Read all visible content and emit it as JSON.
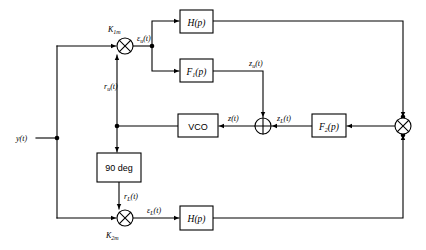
{
  "diagram": {
    "background_color": "#ffffff",
    "line_color": "#000000",
    "blocks": [
      {
        "id": "h_top",
        "label": "H(p)",
        "x": 180,
        "y": 10,
        "w": 33,
        "h": 23,
        "italic": true
      },
      {
        "id": "f1",
        "label": "F",
        "sub": "1",
        "tail": "(p)",
        "x": 180,
        "y": 59,
        "w": 33,
        "h": 23,
        "italic": true
      },
      {
        "id": "vco",
        "label": "VCO",
        "x": 178,
        "y": 114,
        "w": 40,
        "h": 23,
        "italic": false
      },
      {
        "id": "f2",
        "label": "F",
        "sub": "2",
        "tail": "(p)",
        "x": 312,
        "y": 114,
        "w": 34,
        "h": 23,
        "italic": true
      },
      {
        "id": "ninety",
        "label": "90 deg",
        "x": 97,
        "y": 153,
        "w": 44,
        "h": 29,
        "italic": false
      },
      {
        "id": "h_bottom",
        "label": "H(p)",
        "x": 180,
        "y": 206,
        "w": 33,
        "h": 24,
        "italic": true
      }
    ],
    "operators": [
      {
        "id": "mult_k1m",
        "type": "multiplier",
        "symbol": "cross",
        "cx": 125,
        "cy": 46,
        "r": 8
      },
      {
        "id": "mult_k2m",
        "type": "multiplier",
        "symbol": "cross",
        "cx": 125,
        "cy": 218,
        "r": 8
      },
      {
        "id": "summer",
        "type": "summer",
        "symbol": "plus",
        "cx": 263,
        "cy": 126,
        "r": 8
      },
      {
        "id": "mult_right",
        "type": "multiplier",
        "symbol": "cross",
        "cx": 403,
        "cy": 126,
        "r": 8
      }
    ],
    "gain_labels": [
      {
        "id": "k1m",
        "base": "K",
        "sub": "1m",
        "x": 108,
        "y": 32
      },
      {
        "id": "k2m",
        "base": "K",
        "sub": "2m",
        "x": 108,
        "y": 238
      }
    ],
    "signal_labels": [
      {
        "id": "y_t",
        "base": "y",
        "sub": "",
        "tail": "(t)",
        "x": 16,
        "y": 141
      },
      {
        "id": "eps_u",
        "base": "ε",
        "sub": "u",
        "tail": "(t)",
        "x": 141,
        "y": 41
      },
      {
        "id": "r_u",
        "base": "r",
        "sub": "u",
        "tail": "(t)",
        "x": 110,
        "y": 89
      },
      {
        "id": "r_L",
        "base": "r",
        "sub": "L",
        "tail": "(t)",
        "x": 127,
        "y": 199
      },
      {
        "id": "eps_L",
        "base": "ε",
        "sub": "L",
        "tail": "(t)",
        "x": 148,
        "y": 213
      },
      {
        "id": "z_u",
        "base": "z",
        "sub": "u",
        "tail": "(t)",
        "x": 249,
        "y": 66
      },
      {
        "id": "z_t",
        "base": "z",
        "sub": "",
        "tail": "(t)",
        "x": 229,
        "y": 121
      },
      {
        "id": "z_L",
        "base": "z",
        "sub": "L",
        "tail": "(t)",
        "x": 277,
        "y": 121
      }
    ],
    "junction_dots": [
      {
        "id": "dot_y_split",
        "cx": 57,
        "cy": 138
      },
      {
        "id": "dot_eps_u_split",
        "cx": 152,
        "cy": 46
      },
      {
        "id": "dot_vco_split",
        "cx": 117,
        "cy": 126
      },
      {
        "id": "dot_ninety_feed",
        "cx": 117,
        "cy": 126
      },
      {
        "id": "dot_mult_right_top",
        "cx": 403,
        "cy": 126
      }
    ]
  }
}
